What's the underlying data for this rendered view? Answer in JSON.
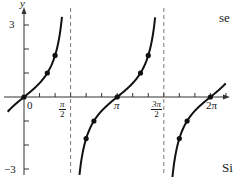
{
  "chart_data": {
    "type": "line",
    "title": "",
    "function": "y = tan x",
    "xlabel": "",
    "ylabel": "y",
    "xlim": [
      -0.3,
      7.0
    ],
    "ylim": [
      -3.2,
      3.3
    ],
    "y_ticks": [
      {
        "value": 3,
        "label": "3"
      },
      {
        "value": -3,
        "label": "−3"
      }
    ],
    "x_ticks": [
      {
        "value": 0,
        "label": "0"
      },
      {
        "value": 1.5708,
        "label": "π/2",
        "num": "π",
        "den": "2"
      },
      {
        "value": 3.1416,
        "label": "π"
      },
      {
        "value": 4.7124,
        "label": "3π/2",
        "num": "3π",
        "den": "2"
      },
      {
        "value": 6.2832,
        "label": "2π"
      }
    ],
    "asymptotes": [
      1.5708,
      4.7124
    ],
    "series": [
      {
        "name": "tan x (branch 1)",
        "x_range": [
          -0.55,
          1.28
        ]
      },
      {
        "name": "tan x (branch 2)",
        "x_range": [
          1.87,
          4.42
        ]
      },
      {
        "name": "tan x (branch 3)",
        "x_range": [
          5.0,
          6.8
        ]
      }
    ],
    "marked_points": [
      {
        "x": 0,
        "y": 0
      },
      {
        "x": 0.7854,
        "y": 1
      },
      {
        "x": 1.0472,
        "y": 1.732
      },
      {
        "x": 2.0944,
        "y": -1.732
      },
      {
        "x": 2.3562,
        "y": -1
      },
      {
        "x": 3.1416,
        "y": 0
      },
      {
        "x": 3.927,
        "y": 1
      },
      {
        "x": 4.1888,
        "y": 1.732
      },
      {
        "x": 5.236,
        "y": -1.732
      },
      {
        "x": 5.4978,
        "y": -1
      },
      {
        "x": 6.2832,
        "y": 0
      }
    ],
    "grid": false,
    "legend": null
  },
  "labels": {
    "y_axis": "y",
    "y_top": "3",
    "y_bottom": "−3",
    "x_zero": "0",
    "x_pi": "π",
    "x_two_pi": "2π",
    "pi_half_num": "π",
    "pi_half_den": "2",
    "three_pi_half_num": "3π",
    "three_pi_half_den": "2"
  },
  "side_text": {
    "top_right": "se",
    "bottom_right": "Si"
  },
  "colors": {
    "curve": "#111111",
    "axis": "#333333",
    "asymptote": "#555555"
  }
}
